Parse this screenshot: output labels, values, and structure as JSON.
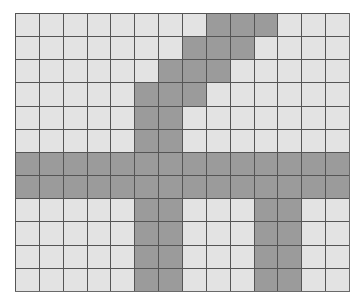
{
  "grid": {
    "columns": 14,
    "rows": 12,
    "colors": {
      "empty": "#e3e3e3",
      "filled": "#9b9b9b",
      "line": "#555555",
      "background": "#ffffff"
    },
    "filled_cells_by_row": [
      [
        8,
        9,
        10
      ],
      [
        7,
        8,
        9
      ],
      [
        6,
        7,
        8
      ],
      [
        5,
        6,
        7
      ],
      [
        5,
        6
      ],
      [
        5,
        6
      ],
      [
        0,
        1,
        2,
        3,
        4,
        5,
        6,
        7,
        8,
        9,
        10,
        11,
        12,
        13
      ],
      [
        0,
        1,
        2,
        3,
        4,
        5,
        6,
        7,
        8,
        9,
        10,
        11,
        12,
        13
      ],
      [
        5,
        6,
        10,
        11
      ],
      [
        5,
        6,
        10,
        11
      ],
      [
        5,
        6,
        10,
        11
      ],
      [
        5,
        6,
        10,
        11
      ]
    ]
  }
}
